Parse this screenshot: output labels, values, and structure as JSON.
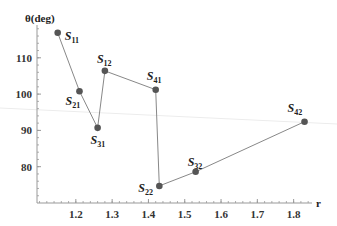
{
  "chart_data": {
    "type": "line",
    "title": "",
    "xlabel": "r",
    "ylabel": "θ(deg)",
    "xlim": [
      1.093,
      1.86
    ],
    "ylim": [
      70,
      119
    ],
    "x_ticks": [
      1.2,
      1.3,
      1.4,
      1.5,
      1.6,
      1.7,
      1.8
    ],
    "x_tick_labels": [
      "1.2",
      "1.3",
      "1.4",
      "1.5",
      "1.6",
      "1.7",
      "1.8"
    ],
    "y_ticks": [
      80,
      90,
      100,
      110
    ],
    "y_tick_labels": [
      "80",
      "90",
      "100",
      "110"
    ],
    "grid": false,
    "legend": null,
    "series": [
      {
        "name": "path",
        "points": [
          {
            "label": "S",
            "sub": "11",
            "r": 1.15,
            "theta": 116.9
          },
          {
            "label": "S",
            "sub": "21",
            "r": 1.21,
            "theta": 100.8
          },
          {
            "label": "S",
            "sub": "31",
            "r": 1.26,
            "theta": 90.7
          },
          {
            "label": "S",
            "sub": "12",
            "r": 1.28,
            "theta": 106.4
          },
          {
            "label": "S",
            "sub": "41",
            "r": 1.42,
            "theta": 101.2
          },
          {
            "label": "S",
            "sub": "22",
            "r": 1.43,
            "theta": 74.7
          },
          {
            "label": "S",
            "sub": "32",
            "r": 1.53,
            "theta": 78.6
          },
          {
            "label": "S",
            "sub": "42",
            "r": 1.83,
            "theta": 92.4
          }
        ]
      }
    ],
    "colors": {
      "line": "#888888",
      "marker": "#555555",
      "axis": "#999999"
    }
  }
}
